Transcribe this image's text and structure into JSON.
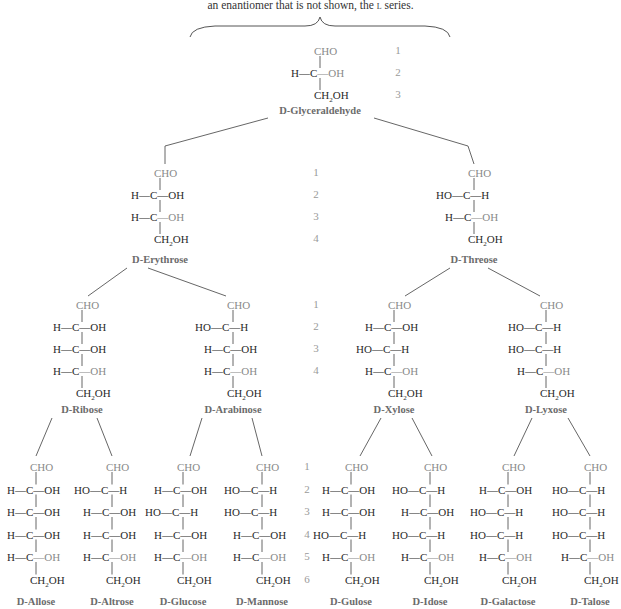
{
  "caption": {
    "text_before": "an enantiomer that is not shown, the ",
    "small_caps": "l",
    "text_after": " series."
  },
  "colors": {
    "text": "#2a2a2a",
    "gray_group": "#8a8a8a",
    "label": "#6b6b6b",
    "number": "#9a9a9a",
    "line": "#444444"
  },
  "sugars": [
    {
      "id": "glyceraldehyde",
      "name": "D-Glyceraldehyde",
      "level": 3,
      "rows": [
        [
          "",
          "CHO",
          ""
        ],
        [
          "H",
          "C",
          "OH"
        ],
        [
          "",
          "CH2OH",
          ""
        ]
      ]
    },
    {
      "id": "erythrose",
      "name": "D-Erythrose",
      "level": 4,
      "rows": [
        [
          "",
          "CHO",
          ""
        ],
        [
          "H",
          "C",
          "OH"
        ],
        [
          "H",
          "C",
          "OH"
        ],
        [
          "",
          "CH2OH",
          ""
        ]
      ]
    },
    {
      "id": "threose",
      "name": "D-Threose",
      "level": 4,
      "rows": [
        [
          "",
          "CHO",
          ""
        ],
        [
          "HO",
          "C",
          "H"
        ],
        [
          "H",
          "C",
          "OH"
        ],
        [
          "",
          "CH2OH",
          ""
        ]
      ]
    },
    {
      "id": "ribose",
      "name": "D-Ribose",
      "level": 5,
      "rows": [
        [
          "",
          "CHO",
          ""
        ],
        [
          "H",
          "C",
          "OH"
        ],
        [
          "H",
          "C",
          "OH"
        ],
        [
          "H",
          "C",
          "OH"
        ],
        [
          "",
          "CH2OH",
          ""
        ]
      ]
    },
    {
      "id": "arabinose",
      "name": "D-Arabinose",
      "level": 5,
      "rows": [
        [
          "",
          "CHO",
          ""
        ],
        [
          "HO",
          "C",
          "H"
        ],
        [
          "H",
          "C",
          "OH"
        ],
        [
          "H",
          "C",
          "OH"
        ],
        [
          "",
          "CH2OH",
          ""
        ]
      ]
    },
    {
      "id": "xylose",
      "name": "D-Xylose",
      "level": 5,
      "rows": [
        [
          "",
          "CHO",
          ""
        ],
        [
          "H",
          "C",
          "OH"
        ],
        [
          "HO",
          "C",
          "H"
        ],
        [
          "H",
          "C",
          "OH"
        ],
        [
          "",
          "CH2OH",
          ""
        ]
      ]
    },
    {
      "id": "lyxose",
      "name": "D-Lyxose",
      "level": 5,
      "rows": [
        [
          "",
          "CHO",
          ""
        ],
        [
          "HO",
          "C",
          "H"
        ],
        [
          "HO",
          "C",
          "H"
        ],
        [
          "H",
          "C",
          "OH"
        ],
        [
          "",
          "CH2OH",
          ""
        ]
      ]
    },
    {
      "id": "allose",
      "name": "D-Allose",
      "level": 6,
      "rows": [
        [
          "",
          "CHO",
          ""
        ],
        [
          "H",
          "C",
          "OH"
        ],
        [
          "H",
          "C",
          "OH"
        ],
        [
          "H",
          "C",
          "OH"
        ],
        [
          "H",
          "C",
          "OH"
        ],
        [
          "",
          "CH2OH",
          ""
        ]
      ]
    },
    {
      "id": "altrose",
      "name": "D-Altrose",
      "level": 6,
      "rows": [
        [
          "",
          "CHO",
          ""
        ],
        [
          "HO",
          "C",
          "H"
        ],
        [
          "H",
          "C",
          "OH"
        ],
        [
          "H",
          "C",
          "OH"
        ],
        [
          "H",
          "C",
          "OH"
        ],
        [
          "",
          "CH2OH",
          ""
        ]
      ]
    },
    {
      "id": "glucose",
      "name": "D-Glucose",
      "level": 6,
      "rows": [
        [
          "",
          "CHO",
          ""
        ],
        [
          "H",
          "C",
          "OH"
        ],
        [
          "HO",
          "C",
          "H"
        ],
        [
          "H",
          "C",
          "OH"
        ],
        [
          "H",
          "C",
          "OH"
        ],
        [
          "",
          "CH2OH",
          ""
        ]
      ]
    },
    {
      "id": "mannose",
      "name": "D-Mannose",
      "level": 6,
      "rows": [
        [
          "",
          "CHO",
          ""
        ],
        [
          "HO",
          "C",
          "H"
        ],
        [
          "HO",
          "C",
          "H"
        ],
        [
          "H",
          "C",
          "OH"
        ],
        [
          "H",
          "C",
          "OH"
        ],
        [
          "",
          "CH2OH",
          ""
        ]
      ]
    },
    {
      "id": "gulose",
      "name": "D-Gulose",
      "level": 6,
      "rows": [
        [
          "",
          "CHO",
          ""
        ],
        [
          "H",
          "C",
          "OH"
        ],
        [
          "H",
          "C",
          "OH"
        ],
        [
          "HO",
          "C",
          "H"
        ],
        [
          "H",
          "C",
          "OH"
        ],
        [
          "",
          "CH2OH",
          ""
        ]
      ]
    },
    {
      "id": "idose",
      "name": "D-Idose",
      "level": 6,
      "rows": [
        [
          "",
          "CHO",
          ""
        ],
        [
          "HO",
          "C",
          "H"
        ],
        [
          "H",
          "C",
          "OH"
        ],
        [
          "HO",
          "C",
          "H"
        ],
        [
          "H",
          "C",
          "OH"
        ],
        [
          "",
          "CH2OH",
          ""
        ]
      ]
    },
    {
      "id": "galactose",
      "name": "D-Galactose",
      "level": 6,
      "rows": [
        [
          "",
          "CHO",
          ""
        ],
        [
          "H",
          "C",
          "OH"
        ],
        [
          "HO",
          "C",
          "H"
        ],
        [
          "HO",
          "C",
          "H"
        ],
        [
          "H",
          "C",
          "OH"
        ],
        [
          "",
          "CH2OH",
          ""
        ]
      ]
    },
    {
      "id": "talose",
      "name": "D-Talose",
      "level": 6,
      "rows": [
        [
          "",
          "CHO",
          ""
        ],
        [
          "HO",
          "C",
          "H"
        ],
        [
          "HO",
          "C",
          "H"
        ],
        [
          "HO",
          "C",
          "H"
        ],
        [
          "H",
          "C",
          "OH"
        ],
        [
          "",
          "CH2OH",
          ""
        ]
      ]
    }
  ],
  "carbon_numbers": {
    "level3": [
      "1",
      "2",
      "3"
    ],
    "level4": [
      "1",
      "2",
      "3",
      "4"
    ],
    "level5": [
      "1",
      "2",
      "3",
      "4"
    ],
    "level6": [
      "1",
      "2",
      "3",
      "4",
      "5",
      "6"
    ]
  }
}
